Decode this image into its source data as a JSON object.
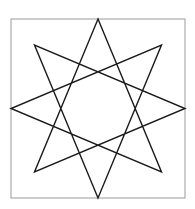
{
  "figure": {
    "type": "line-drawing",
    "background_color": "#ffffff",
    "canvas": {
      "width": 195,
      "height": 209
    },
    "frame": {
      "name": "square-border",
      "x": 11,
      "y": 19,
      "width": 174,
      "height": 179,
      "stroke_color": "#9a9a9a",
      "stroke_width": 1,
      "fill_color": "#ffffff"
    },
    "star": {
      "name": "octagram",
      "schlafli": "{8/3}",
      "points": 8,
      "stroke_color": "#1a1a1a",
      "stroke_width": 1.4,
      "center": {
        "x": 98,
        "y": 108.5
      },
      "outer_vertices": [
        {
          "label": "top",
          "x": 98,
          "y": 19
        },
        {
          "label": "top-right",
          "x": 161.5,
          "y": 45
        },
        {
          "label": "right",
          "x": 185,
          "y": 108.5
        },
        {
          "label": "bottom-right",
          "x": 161.5,
          "y": 172
        },
        {
          "label": "bottom",
          "x": 98,
          "y": 198
        },
        {
          "label": "bottom-left",
          "x": 34.5,
          "y": 172
        },
        {
          "label": "left",
          "x": 11,
          "y": 108.5
        },
        {
          "label": "top-left",
          "x": 34.5,
          "y": 45
        }
      ],
      "inner_vertices": [
        {
          "label": "inner-1",
          "x": 98,
          "y": 62
        },
        {
          "label": "inner-2",
          "x": 130,
          "y": 76
        },
        {
          "label": "inner-3",
          "x": 144,
          "y": 108.5
        },
        {
          "label": "inner-4",
          "x": 130,
          "y": 141
        },
        {
          "label": "inner-5",
          "x": 98,
          "y": 155
        },
        {
          "label": "inner-6",
          "x": 66,
          "y": 141
        },
        {
          "label": "inner-7",
          "x": 52,
          "y": 108.5
        },
        {
          "label": "inner-8",
          "x": 66,
          "y": 76
        }
      ],
      "strands": [
        {
          "name": "strand-a",
          "d": "M 98 19 L 161.5 172 L 11 108.5 L 161.5 45 L 98 198 L 34.5 45 L 185 108.5 L 34.5 172 Z"
        }
      ],
      "outline": {
        "name": "star-outline",
        "d": "M 98 19 L 130 76 L 161.5 45 L 144 108.5 L 161.5 172 L 130 141 L 98 198 L 66 141 L 34.5 172 L 52 108.5 L 34.5 45 L 66 76 Z"
      }
    }
  }
}
